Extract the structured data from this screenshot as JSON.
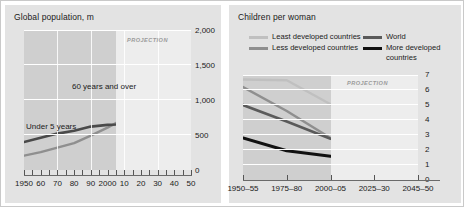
{
  "colors": {
    "panel_bg": "#e3e3e3",
    "plot_bg": "#cfcfcf",
    "projection_bg": "#ededed",
    "grid": "#ffffff",
    "text": "#1a1a1a",
    "projection_text": "#9a9a9a",
    "least_developed": "#c0c0c0",
    "less_developed": "#8f8f8f",
    "world": "#5a5a5a",
    "more_developed": "#111111",
    "over60": "#8f8f8f",
    "under5": "#4a4a4a"
  },
  "left_panel": {
    "title": "Global population, m",
    "projection_label": "PROJECTION",
    "annotations": {
      "over60": "60 years and over",
      "under5": "Under 5 years"
    }
  },
  "right_panel": {
    "title": "Children per woman",
    "projection_label": "PROJECTION",
    "legend": [
      {
        "label": "Least developed countries",
        "color_key": "least_developed"
      },
      {
        "label": "Less developed countries",
        "color_key": "less_developed"
      },
      {
        "label": "World",
        "color_key": "world"
      },
      {
        "label": "More developed countries",
        "color_key": "more_developed"
      }
    ]
  },
  "chart_data": [
    {
      "id": "global-population",
      "type": "line",
      "title": "Global population, m",
      "xlabel": "",
      "ylabel": "Global population, m",
      "ylim": [
        0,
        2000
      ],
      "yticks": [
        0,
        500,
        1000,
        1500,
        2000
      ],
      "ytick_labels": [
        "0",
        "500",
        "1,000",
        "1,500",
        "2,000"
      ],
      "xlim": [
        1950,
        2050
      ],
      "xticks": [
        1950,
        1960,
        1970,
        1980,
        1990,
        2000,
        2010,
        2020,
        2030,
        2040,
        2050
      ],
      "xtick_labels": [
        "1950",
        "60",
        "70",
        "80",
        "90",
        "2000",
        "10",
        "20",
        "30",
        "40",
        "50"
      ],
      "minor_xticks_every": 5,
      "grid": true,
      "legend_position": "inline-annotations",
      "projection_start": 2005,
      "annotations": [
        {
          "text": "PROJECTION",
          "x": 2028,
          "y": 1880
        },
        {
          "text": "60 years and over",
          "x": 1995,
          "y": 1120
        },
        {
          "text": "Under 5 years",
          "x": 1957,
          "y": 700
        }
      ],
      "series": [
        {
          "name": "60 years and over",
          "color": "#8f8f8f",
          "x": [
            1950,
            1960,
            1970,
            1980,
            1990,
            2000,
            2005,
            2010,
            2020,
            2030,
            2040,
            2050
          ],
          "values": [
            205,
            255,
            320,
            385,
            490,
            605,
            670,
            770,
            1010,
            1320,
            1640,
            1950
          ]
        },
        {
          "name": "Under 5 years",
          "color": "#4a4a4a",
          "x": [
            1950,
            1960,
            1970,
            1980,
            1990,
            2000,
            2005,
            2010,
            2020,
            2030,
            2040,
            2050
          ],
          "values": [
            400,
            460,
            520,
            560,
            620,
            645,
            650,
            660,
            668,
            655,
            640,
            625
          ]
        }
      ]
    },
    {
      "id": "children-per-woman",
      "type": "line",
      "title": "Children per woman",
      "xlabel": "",
      "ylabel": "Children per woman",
      "ylim": [
        0,
        7
      ],
      "yticks": [
        0,
        1,
        2,
        3,
        4,
        5,
        6,
        7
      ],
      "ytick_labels": [
        "0",
        "1",
        "2",
        "3",
        "4",
        "5",
        "6",
        "7"
      ],
      "categories": [
        "1950–55",
        "1975–80",
        "2000–05",
        "2025–30",
        "2045–50"
      ],
      "grid": true,
      "legend_position": "top",
      "projection_start_category_index": 2,
      "annotations": [
        {
          "text": "PROJECTION",
          "category_index": 3,
          "y": 6.55
        }
      ],
      "series": [
        {
          "name": "Least developed countries",
          "color": "#c0c0c0",
          "values": [
            6.7,
            6.65,
            5.05,
            3.05,
            2.1
          ]
        },
        {
          "name": "Less developed countries",
          "color": "#8f8f8f",
          "values": [
            6.2,
            4.6,
            2.8,
            2.3,
            2.05
          ]
        },
        {
          "name": "World",
          "color": "#5a5a5a",
          "values": [
            5.0,
            3.9,
            2.75,
            2.3,
            2.05
          ]
        },
        {
          "name": "More developed countries",
          "color": "#111111",
          "values": [
            2.8,
            1.95,
            1.58,
            1.78,
            1.92
          ]
        }
      ]
    }
  ]
}
